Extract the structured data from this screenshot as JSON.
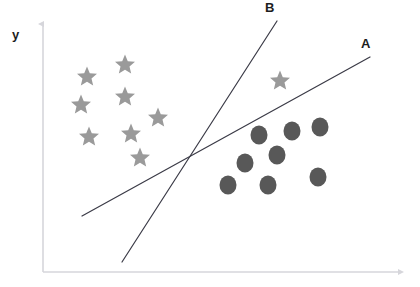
{
  "figure": {
    "title": "",
    "background_color": "#ffffff",
    "axis_color": "#d6d6db",
    "axis": {
      "y_label": "y",
      "x_label": "",
      "origin": [
        43,
        272
      ],
      "y_top": [
        43,
        22
      ],
      "x_right": [
        401,
        272
      ]
    }
  },
  "labels": {
    "line_a": "A",
    "line_b": "B",
    "label_color": "#1d1d1d"
  },
  "chart_data": {
    "type": "scatter",
    "title": "",
    "xlabel": "",
    "ylabel": "y",
    "xlim": [
      0,
      420
    ],
    "ylim": [
      0,
      287
    ],
    "grid": false,
    "legend": "none",
    "annotations": [
      "A",
      "B"
    ],
    "series": [
      {
        "name": "stars",
        "marker": "star",
        "color": "#9a9a9a",
        "size": 21,
        "points": [
          [
            87,
            77
          ],
          [
            125,
            65
          ],
          [
            81,
            105
          ],
          [
            125,
            97
          ],
          [
            158,
            118
          ],
          [
            89,
            137
          ],
          [
            131,
            134
          ],
          [
            140,
            158
          ],
          [
            280,
            81
          ]
        ]
      },
      {
        "name": "circles",
        "marker": "circle",
        "color": "#585858",
        "size": 19,
        "points": [
          [
            320,
            127
          ],
          [
            292,
            131
          ],
          [
            259,
            135
          ],
          [
            277,
            155
          ],
          [
            245,
            163
          ],
          [
            318,
            177
          ],
          [
            268,
            185
          ],
          [
            228,
            185
          ]
        ]
      }
    ],
    "lines": [
      {
        "name": "A",
        "label": "A",
        "color": "#3b3b47",
        "width": 1.2,
        "from": [
          82,
          216
        ],
        "to": [
          370,
          57
        ],
        "label_position": [
          361,
          37
        ]
      },
      {
        "name": "B",
        "label": "B",
        "color": "#3b3b47",
        "width": 1.2,
        "from": [
          122,
          262
        ],
        "to": [
          277,
          21
        ],
        "label_position": [
          265,
          1
        ]
      }
    ],
    "intersection": [
      190,
      157
    ]
  }
}
